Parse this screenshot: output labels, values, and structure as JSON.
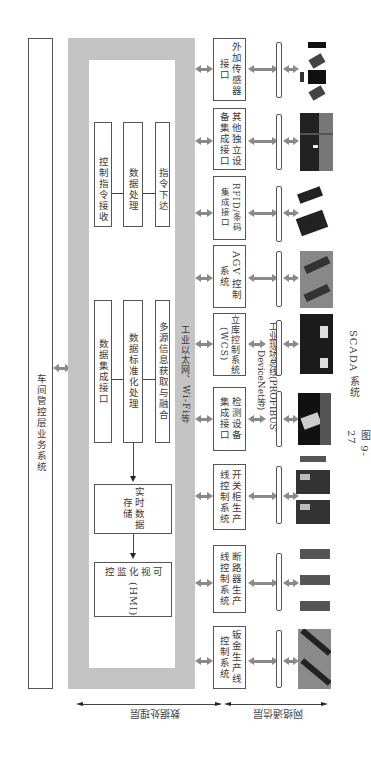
{
  "figure": {
    "caption_number": "图 9-27",
    "caption_title": "SCADA 系统"
  },
  "workshop_layer": {
    "label": "车间管控层业务系统"
  },
  "data_processing": {
    "upper_group": [
      {
        "label": "控制指令接收"
      },
      {
        "label": "数据处理"
      },
      {
        "label": "指令下达"
      }
    ],
    "lower_group": [
      {
        "label": "数据集成接口"
      },
      {
        "label": "数据标准化处理"
      },
      {
        "label": "多源信息获取与融合"
      }
    ],
    "realtime_storage": "实时数据存储",
    "hmi_line1": "可视化监控",
    "hmi_line2": "(HMI)",
    "network_label": "工业以太网、Wi-Fi等"
  },
  "fieldbus_label": "工业现场总线(PROFIBUS、DeviceNet等)",
  "subsystems": [
    {
      "label": "外加传感器接口",
      "image": "sensors"
    },
    {
      "label": "其他独立设备集成接口",
      "image": "control-panel"
    },
    {
      "label": "RFID/条码集成接口",
      "image": "rfid-scanner"
    },
    {
      "label": "AGV 控制系统",
      "image": "agv"
    },
    {
      "label": "立库控制系统 (WCS)",
      "image": "warehouse"
    },
    {
      "label": "检测设备集成接口",
      "image": "inspection-device"
    },
    {
      "label": "开关柜生产线控制系统",
      "image": "switchgear-line"
    },
    {
      "label": "断路器生产线控制系统",
      "image": "breaker-line"
    },
    {
      "label": "钣金生产线控制系统",
      "image": "sheet-metal-line"
    }
  ],
  "layer_labels": {
    "data_processing_layer": "数据处理层",
    "network_layer": "网络通信层"
  },
  "colors": {
    "frame_gray": "#c4c4c4",
    "arrow_gray": "#8a8a8a",
    "border": "#555555"
  }
}
